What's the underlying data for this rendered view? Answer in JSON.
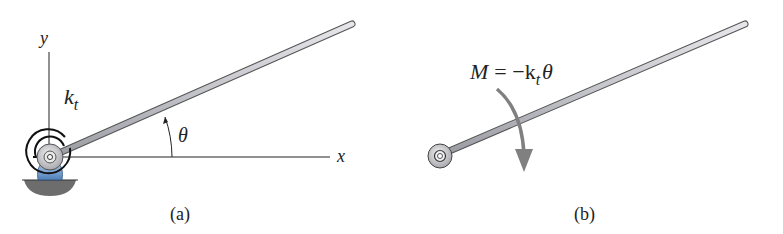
{
  "figure_a": {
    "caption": "(a)",
    "y_axis_label": "y",
    "x_axis_label": "x",
    "spring_label_main": "k",
    "spring_label_sub": "t",
    "angle_label": "θ"
  },
  "figure_b": {
    "caption": "(b)",
    "moment_lhs": "M",
    "moment_eq": "= −k",
    "moment_sub": "t",
    "moment_theta": "θ"
  },
  "colors": {
    "rod_fill": "#c8c8cc",
    "rod_edge": "#555555",
    "support_blue": "#6f9ccf",
    "ground_gray": "#6d6d6d",
    "arrow_gray": "#808080",
    "line": "#222222"
  }
}
